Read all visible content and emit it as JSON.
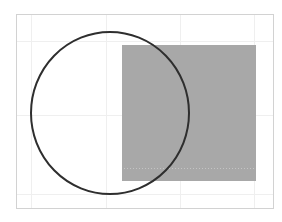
{
  "canvas": {
    "width": 282,
    "height": 222,
    "background": "#ffffff"
  },
  "frame": {
    "x": 16.5,
    "y": 14.5,
    "width": 257,
    "height": 194,
    "stroke": "#d2d2d2"
  },
  "grid": {
    "color": "#efefef",
    "vertical": [
      31,
      106,
      180,
      254
    ],
    "horizontal": [
      41,
      115,
      194
    ]
  },
  "shapes": {
    "rectangle": {
      "x": 122,
      "y": 45,
      "width": 134,
      "height": 136,
      "fill": "#a8a8a8"
    },
    "rectangle_dotted_line": {
      "y": 168,
      "x1": 124,
      "x2": 254,
      "stroke": "#c4c4c4"
    },
    "circle": {
      "cx": 110,
      "cy": 113,
      "rx": 79,
      "ry": 81,
      "stroke": "#2e2e2e",
      "stroke_width": 2,
      "fill": "none"
    }
  }
}
